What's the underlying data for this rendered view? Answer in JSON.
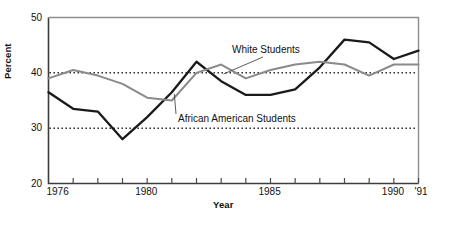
{
  "chart_data": {
    "type": "line",
    "title": "",
    "xlabel": "Year",
    "ylabel": "Percent",
    "xlim": [
      1976,
      1991
    ],
    "ylim": [
      20,
      50
    ],
    "ytick_values": [
      20,
      30,
      40,
      50
    ],
    "ytick_labels": [
      "20",
      "30",
      "40",
      "50"
    ],
    "xtick_values": [
      1976,
      1977,
      1978,
      1979,
      1980,
      1981,
      1982,
      1983,
      1984,
      1985,
      1986,
      1987,
      1988,
      1989,
      1990,
      1991
    ],
    "xtick_labels_shown": [
      {
        "value": 1976,
        "label": "1976"
      },
      {
        "value": 1980,
        "label": "1980"
      },
      {
        "value": 1985,
        "label": "1985"
      },
      {
        "value": 1990,
        "label": "1990"
      },
      {
        "value": 1991,
        "label": "'91"
      }
    ],
    "grid": false,
    "reference_lines": [
      {
        "value": 40,
        "style": "dotted",
        "color": "#1a1a1a"
      },
      {
        "value": 30,
        "style": "dotted",
        "color": "#1a1a1a"
      }
    ],
    "legend_position": "inline-annotations",
    "x": [
      1976,
      1977,
      1978,
      1979,
      1980,
      1981,
      1982,
      1983,
      1984,
      1985,
      1986,
      1987,
      1988,
      1989,
      1990,
      1991
    ],
    "series": [
      {
        "name": "African American Students",
        "color": "#1a1a1a",
        "values": [
          36.5,
          33.5,
          33.0,
          28.0,
          32.0,
          36.5,
          42.0,
          38.5,
          36.0,
          36.0,
          37.0,
          41.0,
          46.0,
          45.5,
          42.5,
          44.0
        ]
      },
      {
        "name": "White Students",
        "color": "#8a8a8a",
        "values": [
          39.0,
          40.5,
          39.5,
          38.0,
          35.5,
          35.0,
          40.0,
          41.5,
          39.0,
          40.5,
          41.5,
          42.0,
          41.5,
          39.5,
          41.5,
          41.5
        ]
      }
    ],
    "annotations": [
      {
        "text": "White Students",
        "target_series": "White Students",
        "target_x": 1983.1,
        "target_y": 39.8
      },
      {
        "text": "African American Students",
        "target_series": "African American Students",
        "target_x": 1981.1,
        "target_y": 36.2
      }
    ]
  }
}
